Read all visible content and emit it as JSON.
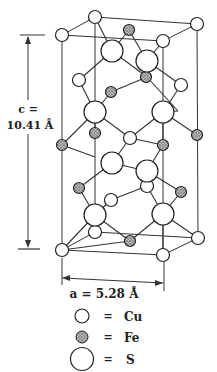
{
  "diagram": {
    "colors": {
      "line": "#333333",
      "cu_fill": "#ffffff",
      "fe_fill": "#9a9a9a",
      "s_fill": "#ffffff"
    },
    "dimension_c": {
      "label_line1": "c =",
      "label_line2": "10.41 Å",
      "arrow": {
        "x": 28,
        "y1": 35,
        "y2": 248
      }
    },
    "dimension_a": {
      "label": "a = 5.28 Å",
      "arrow": {
        "y": 281,
        "x1": 62,
        "x2": 163
      }
    },
    "legend": [
      {
        "symbol": "Cu",
        "eq": "=",
        "label": "Cu",
        "type": "cu",
        "r": 7
      },
      {
        "symbol": "Fe",
        "eq": "=",
        "label": "Fe",
        "type": "fe",
        "r": 6
      },
      {
        "symbol": "S",
        "eq": "=",
        "label": "S",
        "type": "s",
        "r": 12
      }
    ],
    "cell_edges": [
      [
        62,
        35,
        95,
        17
      ],
      [
        95,
        17,
        197,
        24
      ],
      [
        197,
        24,
        163,
        41
      ],
      [
        163,
        41,
        62,
        35
      ],
      [
        62,
        35,
        62,
        250
      ],
      [
        95,
        17,
        95,
        232
      ],
      [
        197,
        24,
        198,
        238
      ],
      [
        163,
        41,
        163,
        255
      ],
      [
        62,
        250,
        95,
        232
      ],
      [
        95,
        232,
        198,
        238
      ],
      [
        198,
        238,
        163,
        255
      ],
      [
        163,
        255,
        62,
        250
      ]
    ],
    "bonds": [
      [
        95,
        17,
        112,
        51
      ],
      [
        129,
        30,
        112,
        51
      ],
      [
        129,
        30,
        147,
        61
      ],
      [
        163,
        41,
        147,
        61
      ],
      [
        112,
        51,
        79,
        80
      ],
      [
        112,
        51,
        147,
        77
      ],
      [
        147,
        61,
        147,
        77
      ],
      [
        147,
        61,
        181,
        85
      ],
      [
        147,
        77,
        111,
        92
      ],
      [
        147,
        77,
        178,
        111
      ],
      [
        79,
        80,
        95,
        112
      ],
      [
        111,
        92,
        95,
        112
      ],
      [
        181,
        85,
        163,
        112
      ],
      [
        178,
        111,
        163,
        112
      ],
      [
        95,
        112,
        62,
        145
      ],
      [
        95,
        112,
        95,
        133
      ],
      [
        95,
        112,
        130,
        138
      ],
      [
        163,
        112,
        163,
        145
      ],
      [
        163,
        112,
        197,
        135
      ],
      [
        163,
        112,
        130,
        138
      ],
      [
        62,
        145,
        95,
        157
      ],
      [
        130,
        138,
        112,
        163
      ],
      [
        130,
        138,
        163,
        145
      ],
      [
        163,
        145,
        147,
        171
      ],
      [
        112,
        163,
        79,
        188
      ],
      [
        112,
        163,
        147,
        171
      ],
      [
        147,
        171,
        147,
        186
      ],
      [
        147,
        171,
        181,
        192
      ],
      [
        79,
        188,
        95,
        215
      ],
      [
        111,
        200,
        95,
        215
      ],
      [
        147,
        186,
        111,
        200
      ],
      [
        181,
        192,
        163,
        214
      ],
      [
        147,
        186,
        163,
        214
      ],
      [
        95,
        215,
        62,
        250
      ],
      [
        95,
        215,
        95,
        232
      ],
      [
        95,
        215,
        130,
        241
      ],
      [
        163,
        214,
        130,
        241
      ],
      [
        163,
        214,
        198,
        238
      ],
      [
        163,
        214,
        163,
        255
      ],
      [
        62,
        250,
        130,
        241
      ]
    ],
    "atoms": [
      {
        "type": "cu",
        "x": 95,
        "y": 17,
        "r": 6.5
      },
      {
        "type": "cu",
        "x": 197,
        "y": 24,
        "r": 6.5
      },
      {
        "type": "cu",
        "x": 62,
        "y": 35,
        "r": 6.5
      },
      {
        "type": "fe",
        "x": 129,
        "y": 30,
        "r": 5.5
      },
      {
        "type": "cu",
        "x": 163,
        "y": 41,
        "r": 6.5
      },
      {
        "type": "s",
        "x": 112,
        "y": 51,
        "r": 11
      },
      {
        "type": "fe",
        "x": 146,
        "y": 77,
        "r": 5.5
      },
      {
        "type": "s",
        "x": 147,
        "y": 61,
        "r": 11
      },
      {
        "type": "cu",
        "x": 79,
        "y": 80,
        "r": 6.5
      },
      {
        "type": "cu",
        "x": 181,
        "y": 85,
        "r": 6.5
      },
      {
        "type": "fe",
        "x": 111,
        "y": 92,
        "r": 5.5
      },
      {
        "type": "fe",
        "x": 95,
        "y": 133,
        "r": 5.5
      },
      {
        "type": "s",
        "x": 95,
        "y": 112,
        "r": 11
      },
      {
        "type": "fe",
        "x": 197,
        "y": 135,
        "r": 5.5
      },
      {
        "type": "s",
        "x": 163,
        "y": 112,
        "r": 11
      },
      {
        "type": "fe",
        "x": 62,
        "y": 145,
        "r": 5.5
      },
      {
        "type": "fe",
        "x": 163,
        "y": 145,
        "r": 5.5
      },
      {
        "type": "cu",
        "x": 130,
        "y": 138,
        "r": 6.5
      },
      {
        "type": "s",
        "x": 112,
        "y": 163,
        "r": 11
      },
      {
        "type": "cu",
        "x": 147,
        "y": 186,
        "r": 6.5
      },
      {
        "type": "s",
        "x": 147,
        "y": 171,
        "r": 11
      },
      {
        "type": "fe",
        "x": 79,
        "y": 188,
        "r": 5.5
      },
      {
        "type": "fe",
        "x": 181,
        "y": 192,
        "r": 5.5
      },
      {
        "type": "cu",
        "x": 111,
        "y": 200,
        "r": 6.5
      },
      {
        "type": "cu",
        "x": 95,
        "y": 232,
        "r": 6.5
      },
      {
        "type": "s",
        "x": 95,
        "y": 215,
        "r": 11
      },
      {
        "type": "s",
        "x": 163,
        "y": 214,
        "r": 11
      },
      {
        "type": "fe",
        "x": 130,
        "y": 241,
        "r": 5.5
      },
      {
        "type": "cu",
        "x": 198,
        "y": 238,
        "r": 6.5
      },
      {
        "type": "cu",
        "x": 62,
        "y": 250,
        "r": 6.5
      },
      {
        "type": "cu",
        "x": 163,
        "y": 255,
        "r": 6.5
      }
    ]
  }
}
